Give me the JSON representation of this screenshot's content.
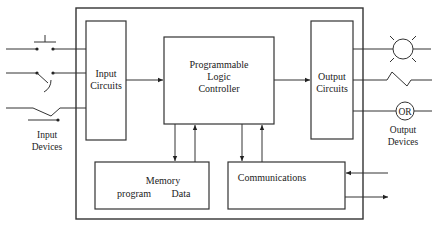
{
  "diagram": {
    "type": "block-diagram",
    "colors": {
      "line": "#333333",
      "background": "#ffffff",
      "text": "#222222"
    },
    "blocks": {
      "input_circuits": {
        "line1": "Input",
        "line2": "Circuits"
      },
      "plc": {
        "line1": "Programmable",
        "line2": "Logic",
        "line3": "Controller"
      },
      "output_circuits": {
        "line1": "Output",
        "line2": "Circuits"
      },
      "memory": {
        "title": "Memory",
        "left": "program",
        "right": "Data"
      },
      "communications": {
        "title": "Communications"
      }
    },
    "labels": {
      "input_devices": {
        "line1": "Input",
        "line2": "Devices"
      },
      "output_devices": {
        "line1": "Output",
        "line2": "Devices"
      },
      "or_symbol": "OR"
    },
    "input_devices": [
      "pushbutton-switch",
      "toggle-switch",
      "limit-switch"
    ],
    "output_devices": [
      "lamp",
      "heater",
      "output-relay"
    ],
    "connections": [
      {
        "from": "input_circuits",
        "to": "plc"
      },
      {
        "from": "plc",
        "to": "output_circuits"
      },
      {
        "from": "plc",
        "to": "memory"
      },
      {
        "from": "memory",
        "to": "plc"
      },
      {
        "from": "plc",
        "to": "communications"
      },
      {
        "from": "communications",
        "to": "plc"
      },
      {
        "from": "external",
        "to": "communications"
      },
      {
        "from": "communications",
        "to": "external"
      }
    ]
  }
}
